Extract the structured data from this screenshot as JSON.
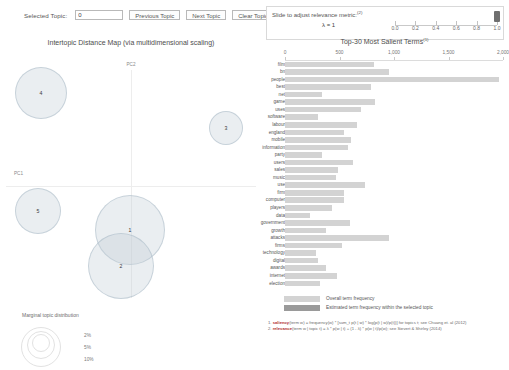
{
  "toolbar": {
    "selected_topic_label": "Selected Topic:",
    "selected_topic_value": "0",
    "previous_topic_label": "Previous Topic",
    "next_topic_label": "Next Topic",
    "clear_topic_label": "Clear Topic"
  },
  "slider": {
    "title": "Slide to adjust relevance metric:",
    "superscript": "(2)",
    "lambda_label": "λ = 1",
    "value": 1.0,
    "ticks": [
      "0.0",
      "0.2",
      "0.4",
      "0.6",
      "0.8",
      "1.0"
    ],
    "tick_values": [
      0.0,
      0.2,
      0.4,
      0.6,
      0.8,
      1.0
    ]
  },
  "left_panel": {
    "title": "Intertopic Distance Map (via multidimensional scaling)",
    "x_axis_label": "PC1",
    "y_axis_label": "PC2",
    "topics": [
      {
        "id": "1",
        "cx": 130,
        "cy": 230,
        "r": 35
      },
      {
        "id": "2",
        "cx": 121,
        "cy": 266,
        "r": 33
      },
      {
        "id": "3",
        "cx": 226,
        "cy": 128,
        "r": 17
      },
      {
        "id": "4",
        "cx": 41,
        "cy": 93,
        "r": 26
      },
      {
        "id": "5",
        "cx": 38,
        "cy": 211,
        "r": 23
      }
    ],
    "marginal_legend": {
      "title": "Marginal topic distribution",
      "sizes": [
        "2%",
        "5%",
        "10%"
      ]
    }
  },
  "chart_data": {
    "type": "bar",
    "title": "Top-30 Most Salient Terms",
    "title_superscript": "(1)",
    "xlabel": "",
    "ylabel": "",
    "xlim": [
      0,
      2000
    ],
    "tick_labels": [
      "0",
      "500",
      "1,000",
      "1,500",
      "2,000"
    ],
    "tick_values": [
      0,
      500,
      1000,
      1500,
      2000
    ],
    "grid": false,
    "orientation": "horizontal",
    "categories": [
      "film",
      "bn",
      "people",
      "best",
      "net",
      "game",
      "uses",
      "software",
      "labour",
      "england",
      "mobile",
      "information",
      "party",
      "users",
      "sales",
      "music",
      "use",
      "firm",
      "computer",
      "players",
      "data",
      "government",
      "growth",
      "attacks",
      "firms",
      "technology",
      "digital",
      "awards",
      "internet",
      "election"
    ],
    "series": [
      {
        "name": "Overall term frequency",
        "values": [
          820,
          950,
          1960,
          790,
          340,
          830,
          700,
          300,
          660,
          540,
          610,
          580,
          340,
          620,
          490,
          470,
          730,
          540,
          540,
          430,
          230,
          600,
          380,
          950,
          520,
          280,
          300,
          380,
          480,
          320
        ]
      },
      {
        "name": "Estimated term frequency within the selected topic",
        "values": [
          0,
          0,
          0,
          0,
          0,
          0,
          0,
          0,
          0,
          0,
          0,
          0,
          0,
          0,
          0,
          0,
          0,
          0,
          0,
          0,
          0,
          0,
          0,
          0,
          0,
          0,
          0,
          0,
          0,
          0
        ]
      }
    ],
    "legend": [
      {
        "label": "Overall term frequency",
        "color": "#d3d3d3"
      },
      {
        "label": "Estimated term frequency within the selected topic",
        "color": "#9a9a9a"
      }
    ],
    "legend_position": "bottom"
  },
  "footnotes": {
    "line1_prefix": "1. ",
    "line1_term": "saliency",
    "line1_rest": "(term w) = frequency(w) * [sum_t p(t | w) * log(p(t | w)/p(t))] for topics t; see Chuang et. al (2012)",
    "line2_prefix": "2. ",
    "line2_term": "relevance",
    "line2_rest": "(term w | topic t) = λ * p(w | t) + (1 - λ) * p(w | t)/p(w); see Sievert & Shirley (2014)"
  }
}
